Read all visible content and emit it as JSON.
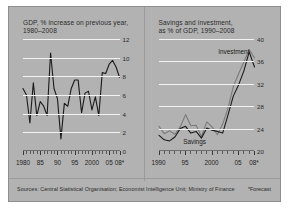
{
  "figure": {
    "background_color": "#b2b2b2",
    "source_note": "Sources: Central Statistical Organisation; Economist Intelligence Unit; Ministry of Finance",
    "forecast_note": "*Forecast"
  },
  "chart_data": [
    {
      "type": "line",
      "id": "gdp",
      "title": "GDP, % increase on previous year,\n1980–2008",
      "xlabel": "",
      "ylabel": "",
      "ylim": [
        0,
        12
      ],
      "yticks": [
        0,
        2,
        4,
        6,
        8,
        10,
        12
      ],
      "ytick_labels": [
        "0",
        "2",
        "4",
        "6",
        "8",
        "10",
        "12"
      ],
      "xlim": [
        1980,
        2008
      ],
      "xtick_positions": [
        1980,
        1985,
        1990,
        1995,
        2000,
        2005,
        2008
      ],
      "xtick_labels": [
        "1980",
        "85",
        "90",
        "95",
        "2000",
        "05",
        "08*"
      ],
      "grid": true,
      "legend": "none",
      "line_color": "#1a1a1a",
      "x": [
        1980,
        1981,
        1982,
        1983,
        1984,
        1985,
        1986,
        1987,
        1988,
        1989,
        1990,
        1991,
        1992,
        1993,
        1994,
        1995,
        1996,
        1997,
        1998,
        1999,
        2000,
        2001,
        2002,
        2003,
        2004,
        2005,
        2006,
        2007,
        2008
      ],
      "values": [
        6.7,
        6.0,
        3.0,
        7.3,
        3.8,
        5.3,
        4.8,
        3.8,
        10.5,
        6.7,
        5.6,
        1.3,
        5.1,
        4.8,
        6.7,
        7.6,
        7.6,
        4.1,
        6.2,
        6.4,
        4.4,
        5.8,
        3.8,
        8.4,
        8.3,
        9.3,
        9.7,
        9.0,
        7.9
      ],
      "series_name": "GDP growth"
    },
    {
      "type": "line",
      "id": "savings-investment",
      "title": "Savings and investment,\nas % of GDP, 1990–2008",
      "xlabel": "",
      "ylabel": "",
      "ylim": [
        20,
        40
      ],
      "yticks": [
        20,
        24,
        28,
        32,
        36,
        40
      ],
      "ytick_labels": [
        "20",
        "24",
        "28",
        "32",
        "36",
        "40"
      ],
      "xlim": [
        1990,
        2008
      ],
      "xtick_positions": [
        1990,
        1995,
        2000,
        2005,
        2008
      ],
      "xtick_labels": [
        "1990",
        "95",
        "2000",
        "05",
        "08*"
      ],
      "grid": true,
      "legend": "inline-labels",
      "annotations": [
        {
          "text": "Investment",
          "x": 2004.2,
          "y": 37.0
        },
        {
          "text": "Savings",
          "x": 1996.8,
          "y": 20.9
        }
      ],
      "series": [
        {
          "name": "Savings",
          "color": "#1a1a1a",
          "values": [
            22.8,
            22.0,
            21.8,
            22.5,
            24.0,
            24.4,
            23.2,
            23.5,
            22.3,
            24.1,
            23.7,
            23.5,
            23.2,
            26.4,
            29.8,
            31.8,
            34.3,
            37.7,
            35.0
          ]
        },
        {
          "name": "Investment",
          "color": "#7b7b7b",
          "values": [
            24.4,
            23.1,
            23.6,
            23.0,
            24.3,
            26.5,
            24.5,
            24.6,
            22.6,
            25.2,
            24.3,
            22.9,
            24.8,
            27.6,
            31.5,
            33.8,
            35.9,
            38.1,
            36.6
          ]
        }
      ],
      "x": [
        1990,
        1991,
        1992,
        1993,
        1994,
        1995,
        1996,
        1997,
        1998,
        1999,
        2000,
        2001,
        2002,
        2003,
        2004,
        2005,
        2006,
        2007,
        2008
      ]
    }
  ]
}
